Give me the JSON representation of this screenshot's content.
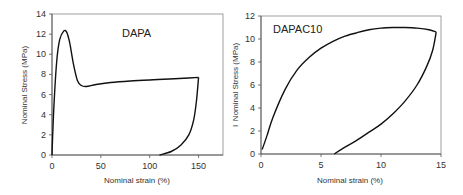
{
  "chart_data": [
    {
      "type": "line",
      "title": "DAPA",
      "annotation": "DAPA",
      "xlabel": "Nominal strain (%)",
      "ylabel": "Nominal Stress (MPa)",
      "xlim": [
        0,
        175
      ],
      "ylim": [
        0,
        14
      ],
      "xticks": [
        "0",
        "50",
        "100",
        "150"
      ],
      "yticks": [
        "0",
        "2",
        "4",
        "6",
        "8",
        "10",
        "12",
        "14"
      ],
      "grid": false,
      "series": [
        {
          "name": "loading",
          "x": [
            0,
            2,
            5,
            8,
            12,
            15,
            18,
            22,
            26,
            30,
            35,
            45,
            60,
            80,
            100,
            120,
            140,
            150
          ],
          "y": [
            0,
            5,
            9.5,
            11.5,
            12.3,
            12.2,
            11.2,
            9.0,
            7.4,
            6.9,
            6.8,
            7.0,
            7.2,
            7.35,
            7.45,
            7.55,
            7.65,
            7.7
          ]
        },
        {
          "name": "unloading",
          "x": [
            150,
            148,
            145,
            140,
            132,
            122,
            110
          ],
          "y": [
            7.7,
            5.5,
            3.5,
            2.0,
            1.0,
            0.35,
            0
          ]
        }
      ]
    },
    {
      "type": "line",
      "title": "DAPAC10",
      "annotation": "DAPAC10",
      "xlabel": "Nominal strain (%)",
      "ylabel": "Nominal Stress (MPa)",
      "xlim": [
        0,
        15
      ],
      "ylim": [
        0,
        12
      ],
      "xticks": [
        "0",
        "5",
        "10",
        "15"
      ],
      "yticks": [
        "0",
        "2",
        "4",
        "6",
        "8",
        "10",
        "12"
      ],
      "grid": false,
      "series": [
        {
          "name": "loading",
          "x": [
            0.1,
            0.5,
            1,
            2,
            3,
            4,
            5,
            6,
            7,
            8,
            9,
            10,
            11,
            12,
            13,
            14,
            14.6
          ],
          "y": [
            0.4,
            1.6,
            3.2,
            5.6,
            7.3,
            8.4,
            9.2,
            9.8,
            10.25,
            10.55,
            10.8,
            10.95,
            11.0,
            11.0,
            10.95,
            10.8,
            10.6
          ]
        },
        {
          "name": "unloading",
          "x": [
            14.6,
            14.3,
            13.8,
            13,
            12,
            11,
            10,
            9,
            8,
            7,
            6.1
          ],
          "y": [
            10.6,
            9.0,
            7.6,
            6.0,
            4.6,
            3.5,
            2.6,
            1.9,
            1.2,
            0.6,
            0
          ]
        }
      ]
    }
  ],
  "plots": [
    {
      "annotation": "DAPA",
      "xlabel": "Nominal strain (%)",
      "ylabel": "Nominal Stress (MPa)",
      "xticks": [
        "0",
        "50",
        "100",
        "150"
      ],
      "yticks": [
        "0",
        "2",
        "4",
        "6",
        "8",
        "10",
        "12",
        "14"
      ]
    },
    {
      "annotation": "DAPAC10",
      "xlabel": "Nominal strain (%)",
      "ylabel": "Nominal Stress (MPa)",
      "xticks": [
        "0",
        "5",
        "10",
        "15"
      ],
      "yticks": [
        "0",
        "2",
        "4",
        "6",
        "8",
        "10",
        "12"
      ],
      "stray_mark": "I"
    }
  ]
}
